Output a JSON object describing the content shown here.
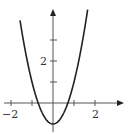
{
  "chart_data": {
    "type": "line",
    "title": "",
    "xlabel": "",
    "ylabel": "",
    "function": "y = 2x^2 - 1",
    "series": [
      {
        "name": "parabola",
        "x": [
          -1.57,
          -1.25,
          -1.0,
          -0.75,
          -0.5,
          -0.25,
          0.0,
          0.25,
          0.5,
          0.75,
          1.0,
          1.25,
          1.65
        ],
        "values": [
          3.93,
          2.13,
          1.0,
          0.13,
          -0.5,
          -0.88,
          -1.0,
          -0.88,
          -0.5,
          0.13,
          1.0,
          2.13,
          4.45
        ]
      }
    ],
    "xlim": [
      -2.0,
      3.4
    ],
    "ylim": [
      -1.4,
      4.5
    ],
    "x_ticks": [
      -2,
      -1,
      1,
      2
    ],
    "x_tick_labels": [
      "-2",
      "",
      "",
      "2"
    ],
    "y_ticks": [
      1,
      2,
      3
    ],
    "y_tick_labels": [
      "",
      "2",
      ""
    ],
    "grid": false,
    "legend": "none",
    "colors": {
      "curve": "#222222",
      "axis": "#555555",
      "label": "#333333"
    }
  },
  "labels": {
    "x_neg2": "−2",
    "x_pos2": "2",
    "y_2": "2"
  }
}
